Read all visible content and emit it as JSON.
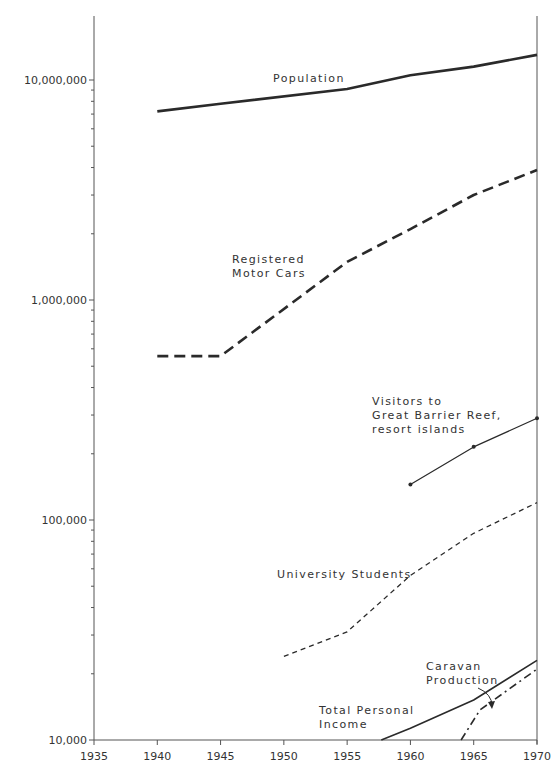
{
  "chart_data": {
    "type": "line",
    "title": "",
    "xlabel": "",
    "ylabel": "",
    "yscale": "log",
    "xlim": [
      1935,
      1970
    ],
    "ylim": [
      10000,
      20000000
    ],
    "grid": false,
    "legend": "inline labels",
    "x_ticks": [
      1935,
      1940,
      1945,
      1950,
      1955,
      1960,
      1965,
      1970
    ],
    "x_tick_labels": [
      "1935",
      "1940",
      "1945",
      "1950",
      "1955",
      "1960",
      "1965",
      "1970"
    ],
    "y_ticks": [
      10000,
      100000,
      1000000,
      10000000
    ],
    "y_tick_labels": [
      "10,000",
      "100,000",
      "1,000,000",
      "10,000,000"
    ],
    "series": [
      {
        "name": "Population",
        "label_lines": [
          "Population"
        ],
        "style": "solid-thick",
        "x": [
          1940,
          1945,
          1955,
          1960,
          1965,
          1970
        ],
        "values": [
          7200000,
          7800000,
          9100000,
          10500000,
          11500000,
          13000000
        ]
      },
      {
        "name": "Registered Motor Cars",
        "label_lines": [
          "Registered",
          "Motor Cars"
        ],
        "style": "dashed-thick",
        "x": [
          1940,
          1945,
          1955,
          1960,
          1965,
          1970
        ],
        "values": [
          556000,
          556000,
          1490000,
          2100000,
          3000000,
          3900000
        ]
      },
      {
        "name": "Visitors to Great Barrier Reef, resort islands",
        "label_lines": [
          "Visitors to",
          "Great Barrier Reef,",
          "resort islands"
        ],
        "style": "solid-thin-markers",
        "x": [
          1960,
          1965,
          1970
        ],
        "values": [
          145000,
          215000,
          290000
        ]
      },
      {
        "name": "University Students",
        "label_lines": [
          "University Students"
        ],
        "style": "dashed-thin",
        "x": [
          1950,
          1955,
          1960,
          1965,
          1970
        ],
        "values": [
          24000,
          31000,
          56000,
          87000,
          120000
        ]
      },
      {
        "name": "Total Personal Income",
        "label_lines": [
          "Total Personal",
          "Income"
        ],
        "style": "solid-medium",
        "x": [
          1957.7,
          1960,
          1965,
          1970
        ],
        "values": [
          10000,
          11300,
          15200,
          23000
        ]
      },
      {
        "name": "Caravan Production",
        "label_lines": [
          "Caravan",
          "Production"
        ],
        "style": "dash-dot",
        "x": [
          1964,
          1965.5,
          1970
        ],
        "values": [
          10000,
          13700,
          21000
        ]
      }
    ]
  }
}
